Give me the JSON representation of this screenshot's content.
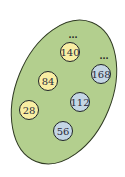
{
  "diagram": {
    "set": {
      "fill": "#b3cf8e",
      "stroke": "#2f3a22",
      "cx": 64,
      "cy": 92,
      "rx": 48,
      "ry": 75,
      "rotate": 22
    },
    "nodes": [
      {
        "label": "140",
        "cx": 70,
        "cy": 52,
        "color": "yellow"
      },
      {
        "label": "168",
        "cx": 101,
        "cy": 74,
        "color": "blue"
      },
      {
        "label": "84",
        "cx": 48,
        "cy": 81,
        "color": "yellow"
      },
      {
        "label": "112",
        "cx": 80,
        "cy": 102,
        "color": "blue"
      },
      {
        "label": "28",
        "cx": 29,
        "cy": 110,
        "color": "yellow"
      },
      {
        "label": "56",
        "cx": 63,
        "cy": 131,
        "color": "blue"
      }
    ],
    "ellipses_marks": [
      {
        "text": "...",
        "x": 73,
        "y": 36
      },
      {
        "text": "...",
        "x": 104,
        "y": 57
      }
    ],
    "colors": {
      "yellow_fill": "#f8eea3",
      "blue_fill": "#c4d6e4",
      "node_stroke": "#1f2428"
    }
  }
}
